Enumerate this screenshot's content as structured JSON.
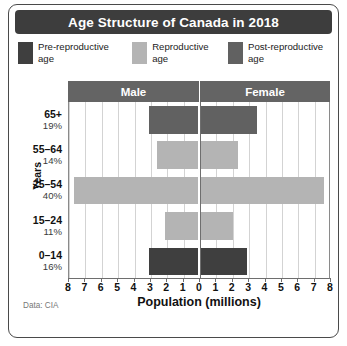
{
  "title": "Age Structure of Canada in 2018",
  "source": "Data: CIA",
  "colors": {
    "pre_reproductive": "#3f3f3f",
    "reproductive": "#b4b4b4",
    "post_reproductive": "#616161",
    "title_bar": "#3d3d3d",
    "sex_header": "#646464",
    "gridline": "#d3d3d3",
    "axis": "#6e6e6e",
    "card_border": "#4a4a4a"
  },
  "legend": {
    "items": [
      {
        "label": "Pre-reproductive age",
        "color_key": "pre_reproductive",
        "swatch_name": "legend-swatch-pre-reproductive"
      },
      {
        "label": "Reproductive age",
        "color_key": "reproductive",
        "swatch_name": "legend-swatch-reproductive"
      },
      {
        "label": "Post-reproductive age",
        "color_key": "post_reproductive",
        "swatch_name": "legend-swatch-post-reproductive"
      }
    ]
  },
  "sex_header": {
    "male": "Male",
    "female": "Female"
  },
  "axes": {
    "y_title": "Years",
    "x_title": "Population (millions)"
  },
  "chart_data": {
    "type": "bar",
    "subtype": "population-pyramid",
    "title": "Age Structure of Canada in 2018",
    "xlabel": "Population (millions)",
    "ylabel": "Years",
    "xlim": [
      -8,
      8
    ],
    "xticks": [
      8,
      7,
      6,
      5,
      4,
      3,
      2,
      1,
      0,
      1,
      2,
      3,
      4,
      5,
      6,
      7,
      8
    ],
    "xtick_values": [
      -8,
      -7,
      -6,
      -5,
      -4,
      -3,
      -2,
      -1,
      0,
      1,
      2,
      3,
      4,
      5,
      6,
      7,
      8
    ],
    "grid": true,
    "legend_position": "top",
    "categories": [
      "65+",
      "55–64",
      "25–54",
      "15–24",
      "0–14"
    ],
    "category_percent": [
      "19%",
      "14%",
      "40%",
      "11%",
      "16%"
    ],
    "series": [
      {
        "name": "Male",
        "values": [
          3.0,
          2.5,
          7.6,
          2.0,
          3.0
        ]
      },
      {
        "name": "Female",
        "values": [
          3.5,
          2.3,
          7.6,
          2.0,
          2.9
        ]
      }
    ],
    "rows": [
      {
        "group": "65+",
        "percent": "19%",
        "male": 3.0,
        "female": 3.5,
        "color_key": "post_reproductive"
      },
      {
        "group": "55–64",
        "percent": "14%",
        "male": 2.5,
        "female": 2.3,
        "color_key": "reproductive"
      },
      {
        "group": "25–54",
        "percent": "40%",
        "male": 7.6,
        "female": 7.6,
        "color_key": "reproductive"
      },
      {
        "group": "15–24",
        "percent": "11%",
        "male": 2.0,
        "female": 2.0,
        "color_key": "reproductive"
      },
      {
        "group": "0–14",
        "percent": "16%",
        "male": 3.0,
        "female": 2.9,
        "color_key": "pre_reproductive"
      }
    ]
  }
}
